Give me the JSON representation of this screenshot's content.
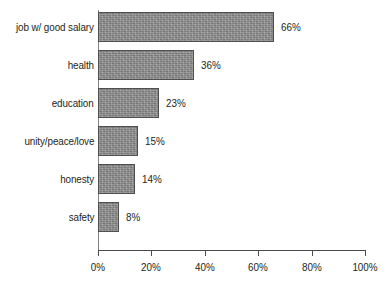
{
  "chart_data": {
    "type": "bar",
    "orientation": "horizontal",
    "title": "",
    "xlabel": "",
    "ylabel": "",
    "xlim": [
      0,
      100
    ],
    "grid": false,
    "legend": false,
    "categories": [
      "job w/ good salary",
      "health",
      "education",
      "unity/peace/love",
      "honesty",
      "safety"
    ],
    "values": [
      66,
      36,
      23,
      15,
      14,
      8
    ],
    "value_labels": [
      "66%",
      "36%",
      "23%",
      "15%",
      "14%",
      "8%"
    ],
    "xticks": [
      0,
      20,
      40,
      60,
      80,
      100
    ],
    "xtick_labels": [
      "0%",
      "20%",
      "40%",
      "60%",
      "80%",
      "100%"
    ],
    "colors": {
      "bar_fill": "#8d8d8d",
      "bar_border": "#4f4f4f",
      "axis": "#4a4a4a",
      "text": "#231f20",
      "background": "#ffffff"
    }
  }
}
